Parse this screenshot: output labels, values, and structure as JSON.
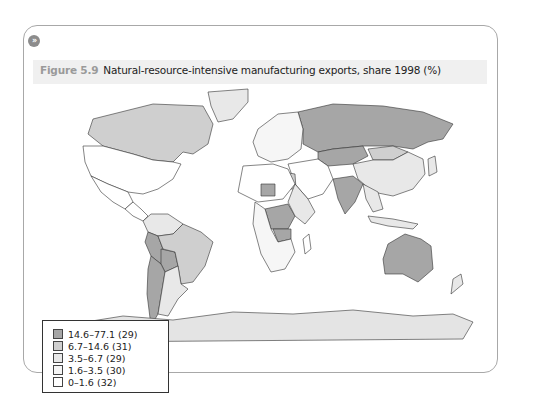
{
  "badge": {
    "icon": "double-chevron-right-icon",
    "glyph": "»"
  },
  "figure": {
    "label": "Figure 5.9",
    "title": "Natural-resource-intensive manufacturing exports, share 1998 (%)"
  },
  "colors": {
    "class_1": "#a6a6a6",
    "class_2": "#cfcfcf",
    "class_3": "#e8e8e8",
    "class_4": "#f6f6f6",
    "class_5": "#ffffff",
    "antarctica": "#e4e4e4",
    "border": "#333333"
  },
  "legend": {
    "items": [
      {
        "label": "14.6–77.1 (29)",
        "range": [
          14.6,
          77.1
        ],
        "count": 29,
        "color": "#a6a6a6"
      },
      {
        "label": "6.7–14.6 (31)",
        "range": [
          6.7,
          14.6
        ],
        "count": 31,
        "color": "#cfcfcf"
      },
      {
        "label": "3.5–6.7 (29)",
        "range": [
          3.5,
          6.7
        ],
        "count": 29,
        "color": "#e8e8e8"
      },
      {
        "label": "1.6–3.5 (30)",
        "range": [
          1.6,
          3.5
        ],
        "count": 30,
        "color": "#f6f6f6"
      },
      {
        "label": "0–1.6 (32)",
        "range": [
          0,
          1.6
        ],
        "count": 32,
        "color": "#ffffff"
      }
    ]
  },
  "chart_data": {
    "type": "choropleth",
    "title": "Natural-resource-intensive manufacturing exports, share 1998 (%)",
    "legend_position": "bottom-left",
    "classes": [
      {
        "label": "14.6–77.1",
        "count": 29
      },
      {
        "label": "6.7–14.6",
        "count": 31
      },
      {
        "label": "3.5–6.7",
        "count": 29
      },
      {
        "label": "1.6–3.5",
        "count": 30
      },
      {
        "label": "0–1.6",
        "count": 32
      }
    ],
    "regions": [
      {
        "name": "Canada",
        "class": 2
      },
      {
        "name": "Greenland",
        "class": 3
      },
      {
        "name": "United States",
        "class": 5
      },
      {
        "name": "Mexico",
        "class": 5
      },
      {
        "name": "Central America",
        "class": 5
      },
      {
        "name": "Colombia/Venezuela",
        "class": 3
      },
      {
        "name": "Peru",
        "class": 1
      },
      {
        "name": "Bolivia",
        "class": 1
      },
      {
        "name": "Brazil",
        "class": 2
      },
      {
        "name": "Chile",
        "class": 1
      },
      {
        "name": "Argentina",
        "class": 3
      },
      {
        "name": "Russia",
        "class": 1
      },
      {
        "name": "Kazakhstan",
        "class": 1
      },
      {
        "name": "Mongolia",
        "class": 2
      },
      {
        "name": "China",
        "class": 3
      },
      {
        "name": "India",
        "class": 1
      },
      {
        "name": "Europe",
        "class": 4
      },
      {
        "name": "Middle East",
        "class": 5
      },
      {
        "name": "Egypt",
        "class": 2
      },
      {
        "name": "North Africa",
        "class": 5
      },
      {
        "name": "Niger",
        "class": 1
      },
      {
        "name": "DR Congo",
        "class": 1
      },
      {
        "name": "Zambia",
        "class": 1
      },
      {
        "name": "Southern Africa",
        "class": 4
      },
      {
        "name": "East Africa",
        "class": 3
      },
      {
        "name": "Madagascar",
        "class": 5
      },
      {
        "name": "Southeast Asia",
        "class": 3
      },
      {
        "name": "Indonesia",
        "class": 3
      },
      {
        "name": "Japan",
        "class": 3
      },
      {
        "name": "Australia",
        "class": 1
      },
      {
        "name": "New Zealand",
        "class": 3
      },
      {
        "name": "Antarctica",
        "class": "no data"
      }
    ]
  }
}
